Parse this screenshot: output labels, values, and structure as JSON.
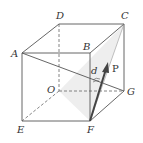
{
  "diagram": {
    "vertices": {
      "A": {
        "label": "A",
        "x": 22,
        "y": 53
      },
      "B": {
        "label": "B",
        "x": 90,
        "y": 53
      },
      "C": {
        "label": "C",
        "x": 124,
        "y": 24
      },
      "D": {
        "label": "D",
        "x": 59,
        "y": 24
      },
      "E": {
        "label": "E",
        "x": 22,
        "y": 121
      },
      "F": {
        "label": "F",
        "x": 90,
        "y": 121
      },
      "G": {
        "label": "G",
        "x": 124,
        "y": 91
      },
      "O": {
        "label": "O",
        "x": 59,
        "y": 91
      }
    },
    "vector": {
      "label": "P",
      "from": "F",
      "tip_x": 108,
      "tip_y": 63
    },
    "angle_label": "d",
    "colors": {
      "edge": "#555555",
      "shade": "#e6e6e6",
      "vector": "#444444"
    }
  }
}
